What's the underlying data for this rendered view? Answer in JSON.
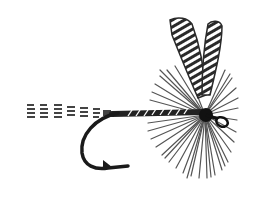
{
  "image": {
    "subject": "Dry fly fishing lure illustration",
    "caption": "",
    "colors": {
      "background": "#ffffff",
      "ink": "#1a1a1a",
      "hackle": "#5a5a5a",
      "wing": "#3a3a3a"
    },
    "parts": [
      "tail",
      "hook",
      "shank-body",
      "hackle",
      "wings",
      "eye"
    ]
  }
}
